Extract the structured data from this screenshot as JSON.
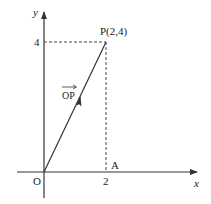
{
  "diagram": {
    "type": "coordinate-vector",
    "axes": {
      "x_label": "x",
      "y_label": "y",
      "origin_label": "O"
    },
    "ticks": {
      "x_tick": "2",
      "y_tick": "4"
    },
    "points": {
      "P": {
        "label": "P(2,4)",
        "x": 2,
        "y": 4
      },
      "A": {
        "label": "A",
        "x": 2,
        "y": 0
      }
    },
    "vector": {
      "label": "OP",
      "from": "O",
      "to": "P"
    },
    "colors": {
      "line": "#333333",
      "dashed": "#444444",
      "background": "#ffffff"
    }
  }
}
